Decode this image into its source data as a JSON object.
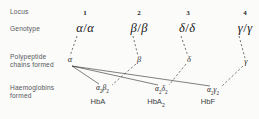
{
  "figure": {
    "background_color": "#fbfbfa",
    "line_color": "#3a3a3a",
    "title": ""
  },
  "row_labels": [
    {
      "id": "locus",
      "text": "Locus",
      "x": 10,
      "y": 12
    },
    {
      "id": "genotype",
      "text": "Genotype",
      "x": 10,
      "y": 29
    },
    {
      "id": "polypeptide",
      "text": "Polypeptide\nchains formed",
      "x": 10,
      "y": 57
    },
    {
      "id": "haemoglobins",
      "text": "Haemoglobins\nformed",
      "x": 10,
      "y": 88
    }
  ],
  "loci": [
    {
      "number": "1",
      "number_x": 78,
      "number_y": 11,
      "genotype_allele": "α",
      "genotype_text": "α",
      "genotype_x": 65,
      "genotype_y": 23,
      "chain_symbol": "α",
      "chain_x": 62,
      "chain_y": 60
    },
    {
      "number": "2",
      "number_x": 132,
      "number_y": 11,
      "genotype_allele": "β",
      "genotype_text": "β",
      "genotype_x": 119,
      "genotype_y": 23,
      "chain_symbol": "β",
      "chain_x": 132,
      "chain_y": 60
    },
    {
      "number": "3",
      "number_x": 180,
      "number_y": 11,
      "genotype_allele": "δ",
      "genotype_text": "δ",
      "genotype_x": 167,
      "genotype_y": 23,
      "chain_symbol": "δ",
      "chain_x": 180,
      "chain_y": 60
    },
    {
      "number": "4",
      "number_x": 238,
      "number_y": 11,
      "genotype_allele": "γ",
      "genotype_text": "γ",
      "genotype_x": 225,
      "genotype_y": 23,
      "chain_symbol": "γ",
      "chain_x": 238,
      "chain_y": 62
    }
  ],
  "haemoglobins": [
    {
      "id": "hba",
      "formula_first": "α",
      "formula_first_sub": "2",
      "formula_second": "β",
      "formula_second_sub": "2",
      "name": "HbA",
      "name_sub": "",
      "formula_x": 97,
      "formula_y": 88,
      "name_x": 97,
      "name_y": 100
    },
    {
      "id": "hba2",
      "formula_first": "α",
      "formula_first_sub": "2",
      "formula_second": "δ",
      "formula_second_sub": "2",
      "name": "HbA",
      "name_sub": "2",
      "formula_x": 156,
      "formula_y": 88,
      "name_x": 155,
      "name_y": 100
    },
    {
      "id": "hbf",
      "formula_first": "α",
      "formula_first_sub": "2",
      "formula_second": "γ",
      "formula_second_sub": "2",
      "name": "HbF",
      "name_sub": "",
      "formula_x": 208,
      "formula_y": 88,
      "name_x": 206,
      "name_y": 100
    }
  ],
  "connectors": {
    "dashed_genotype_to_chain": [
      {
        "from_locus": "1",
        "x1": 77,
        "y1": 36,
        "x2": 70,
        "y2": 56
      },
      {
        "from_locus": "2",
        "x1": 133,
        "y1": 36,
        "x2": 138,
        "y2": 56
      },
      {
        "from_locus": "3",
        "x1": 181,
        "y1": 36,
        "x2": 188,
        "y2": 56
      },
      {
        "from_locus": "4",
        "x1": 239,
        "y1": 36,
        "x2": 245,
        "y2": 58
      }
    ],
    "alpha_to_haemoglobins": [
      {
        "label": "alpha-to-hba",
        "x1": 72,
        "y1": 66,
        "x2": 99,
        "y2": 84
      },
      {
        "label": "alpha-to-hba2",
        "x1": 72,
        "y1": 66,
        "x2": 158,
        "y2": 85
      },
      {
        "label": "alpha-to-hbf",
        "x1": 72,
        "y1": 66,
        "x2": 210,
        "y2": 86
      }
    ],
    "chain_to_haemoglobin": [
      {
        "label": "beta-to-hba",
        "x1": 136,
        "y1": 64,
        "x2": 112,
        "y2": 85
      },
      {
        "label": "delta-to-hba2",
        "x1": 186,
        "y1": 64,
        "x2": 169,
        "y2": 85
      },
      {
        "label": "gamma-to-hbf",
        "x1": 243,
        "y1": 66,
        "x2": 221,
        "y2": 87
      }
    ]
  }
}
